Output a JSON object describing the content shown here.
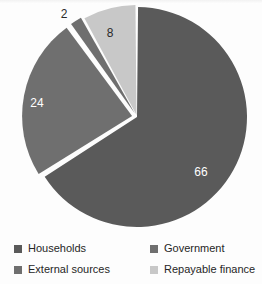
{
  "chart_data": {
    "type": "pie",
    "title": "",
    "labels": [
      "Households",
      "Government",
      "External sources",
      "Repayable finance"
    ],
    "values": [
      66,
      24,
      2,
      8
    ],
    "value_labels": [
      "66",
      "24",
      "2",
      "8"
    ],
    "colors": [
      "#5a5a5a",
      "#6f6f6f",
      "#6f6f6f",
      "#c8c8c8"
    ],
    "label_text_colors": [
      "#ffffff",
      "#ffffff",
      "#2b2b2b",
      "#2b2b2b"
    ],
    "units": "percent",
    "total": 100,
    "start_angle_deg": 0,
    "direction": "clockwise",
    "separator_color": "#ffffff",
    "legend_position": "bottom",
    "legend_columns": 2,
    "grid": false
  },
  "legend": {
    "items": [
      {
        "label": "Households",
        "color": "#5a5a5a"
      },
      {
        "label": "Government",
        "color": "#6f6f6f"
      },
      {
        "label": "External sources",
        "color": "#6f6f6f"
      },
      {
        "label": "Repayable finance",
        "color": "#c8c8c8"
      }
    ]
  },
  "slice_annotations": {
    "households": "66",
    "government": "24",
    "external_sources": "2",
    "repayable_finance": "8"
  }
}
